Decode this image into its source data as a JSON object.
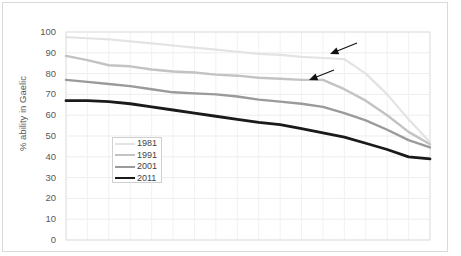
{
  "chart_data": {
    "type": "line",
    "title": "",
    "xlabel": "",
    "ylabel": "% ability in Gaelic",
    "ylim": [
      0,
      100
    ],
    "ytick_labels": [
      "100",
      "90",
      "80",
      "70",
      "60",
      "50",
      "40",
      "30",
      "20",
      "10",
      "0"
    ],
    "ytick_values": [
      100,
      90,
      80,
      70,
      60,
      50,
      40,
      30,
      20,
      10,
      0
    ],
    "xlim": [
      0,
      17
    ],
    "x": [
      0,
      1,
      2,
      3,
      4,
      5,
      6,
      7,
      8,
      9,
      10,
      11,
      12,
      13,
      14,
      15,
      16,
      17
    ],
    "grid": true,
    "legend_position": "inside-left",
    "series": [
      {
        "name": "1981",
        "color": "#e3e3e3",
        "width": 2.2,
        "values": [
          97.5,
          97.0,
          96.5,
          95.5,
          94.5,
          93.5,
          92.5,
          91.5,
          90.5,
          89.5,
          89.0,
          88.0,
          87.5,
          87.0,
          80.0,
          70.0,
          58.0,
          47.0
        ]
      },
      {
        "name": "1991",
        "color": "#c3c3c3",
        "width": 2.4,
        "values": [
          88.5,
          86.5,
          84.0,
          83.5,
          82.0,
          81.0,
          80.5,
          79.5,
          79.0,
          78.0,
          77.5,
          77.0,
          77.0,
          72.5,
          67.0,
          60.0,
          52.0,
          46.0
        ]
      },
      {
        "name": "2001",
        "color": "#9a9a9a",
        "width": 2.4,
        "values": [
          77.0,
          76.0,
          75.0,
          74.0,
          72.5,
          71.0,
          70.5,
          70.0,
          69.0,
          67.5,
          66.5,
          65.5,
          64.0,
          61.0,
          57.5,
          53.0,
          48.0,
          44.5
        ]
      },
      {
        "name": "2011",
        "color": "#1a1a1a",
        "width": 2.8,
        "values": [
          67.0,
          67.0,
          66.5,
          65.5,
          64.0,
          62.5,
          61.0,
          59.5,
          58.0,
          56.5,
          55.5,
          53.5,
          51.5,
          49.5,
          46.5,
          43.5,
          40.0,
          39.0
        ]
      }
    ],
    "annotations": [
      {
        "name": "arrow-upper",
        "target_series": "1981",
        "head": {
          "x": 330,
          "y": 54
        },
        "tail": {
          "x": 357,
          "y": 43
        }
      },
      {
        "name": "arrow-lower",
        "target_series": "1991",
        "head": {
          "x": 309,
          "y": 80
        },
        "tail": {
          "x": 334,
          "y": 70
        }
      }
    ]
  },
  "legend": {
    "items": [
      {
        "label": "1981"
      },
      {
        "label": "1991"
      },
      {
        "label": "2001"
      },
      {
        "label": "2011"
      }
    ]
  }
}
